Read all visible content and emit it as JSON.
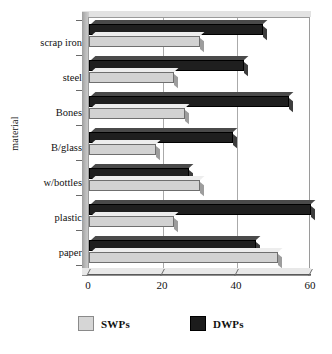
{
  "chart_data": {
    "type": "bar",
    "orientation": "horizontal",
    "title": "",
    "xlabel": "",
    "ylabel": "material",
    "categories": [
      "scrap iron",
      "steel",
      "Bones",
      "B/glass",
      "w/bottles",
      "plastic",
      "paper"
    ],
    "series": [
      {
        "name": "SWPs",
        "color": "#d2d2d2",
        "values": [
          30,
          23,
          26,
          18,
          30,
          23,
          51
        ]
      },
      {
        "name": "DWPs",
        "color": "#1f1f1f",
        "values": [
          47,
          42,
          54,
          39,
          27,
          60,
          45
        ]
      }
    ],
    "xlim": [
      0,
      60
    ],
    "xticks": [
      0,
      20,
      40,
      60
    ],
    "xticklabels": [
      "0",
      "20",
      "40",
      "60"
    ],
    "grid": true,
    "grid_axis": "x",
    "legend_position": "bottom"
  },
  "legend": {
    "items": [
      {
        "label": "SWPs",
        "swatch": "light-gray-square"
      },
      {
        "label": "DWPs",
        "swatch": "black-square"
      }
    ]
  }
}
